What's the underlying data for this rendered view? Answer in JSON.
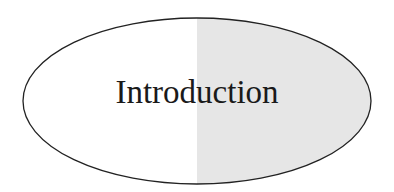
{
  "diagram": {
    "title": "Introduction",
    "shape": "ellipse",
    "colors": {
      "left_fill": "#ffffff",
      "right_fill": "#e6e6e6",
      "stroke": "#222222",
      "text": "#1a1a1a"
    }
  }
}
